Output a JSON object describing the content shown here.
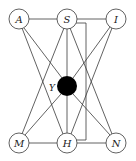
{
  "diagram": {
    "title": "",
    "colors": {
      "line": "#3a3a3a",
      "node_fill": "#ffffff",
      "center_fill": "#000000"
    },
    "nodes": [
      {
        "id": "A",
        "label": "A",
        "cx": 19,
        "cy": 19
      },
      {
        "id": "S",
        "label": "S",
        "cx": 67,
        "cy": 19
      },
      {
        "id": "I",
        "label": "I",
        "cx": 116,
        "cy": 19
      },
      {
        "id": "M",
        "label": "M",
        "cx": 19,
        "cy": 143
      },
      {
        "id": "H",
        "label": "H",
        "cx": 67,
        "cy": 143
      },
      {
        "id": "N",
        "label": "N",
        "cx": 116,
        "cy": 143
      }
    ],
    "center_node": {
      "id": "Y",
      "label": "Y",
      "cx": 67,
      "cy": 86
    },
    "edges": [
      [
        "A",
        "S"
      ],
      [
        "S",
        "I"
      ],
      [
        "M",
        "H"
      ],
      [
        "H",
        "N"
      ],
      [
        "A",
        "Y"
      ],
      [
        "A",
        "H"
      ],
      [
        "S",
        "M"
      ],
      [
        "S",
        "Y"
      ],
      [
        "S",
        "N"
      ],
      [
        "I",
        "Y"
      ],
      [
        "I",
        "H"
      ],
      [
        "M",
        "Y"
      ],
      [
        "N",
        "Y"
      ],
      [
        "H",
        "Y"
      ]
    ]
  }
}
